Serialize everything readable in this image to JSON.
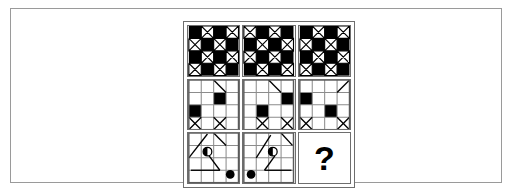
{
  "figure": {
    "kind": "matrix-reasoning-puzzle",
    "rows": 3,
    "columns": 3,
    "background_color": "#ffffff",
    "line_color": "#000000",
    "fill_color": "#000000",
    "frame_color": "#9a9a9a",
    "panel_border_color": "#6e6e6e"
  },
  "matrix": {
    "cells": [
      {
        "id": "cell-r1c1",
        "row": 1,
        "column": 1,
        "label": "top-left",
        "pattern": "checkerboard-4x4-with-triangles",
        "grid": 4,
        "black_squares": [
          [
            0,
            0
          ],
          [
            0,
            2
          ],
          [
            1,
            1
          ],
          [
            1,
            3
          ],
          [
            2,
            0
          ],
          [
            2,
            2
          ],
          [
            3,
            1
          ],
          [
            3,
            3
          ]
        ],
        "triangle_cells": [
          [
            0,
            1
          ],
          [
            0,
            3
          ],
          [
            1,
            0
          ],
          [
            1,
            2
          ],
          [
            2,
            1
          ],
          [
            2,
            3
          ],
          [
            3,
            0
          ],
          [
            3,
            2
          ]
        ],
        "is_question": false
      },
      {
        "id": "cell-r1c2",
        "row": 1,
        "column": 2,
        "label": "top-center",
        "pattern": "checkerboard-4x4-with-triangles",
        "grid": 4,
        "black_squares": [
          [
            0,
            1
          ],
          [
            0,
            3
          ],
          [
            1,
            0
          ],
          [
            1,
            2
          ],
          [
            2,
            1
          ],
          [
            2,
            3
          ],
          [
            3,
            0
          ],
          [
            3,
            2
          ]
        ],
        "triangle_cells": [
          [
            0,
            0
          ],
          [
            0,
            2
          ],
          [
            1,
            1
          ],
          [
            1,
            3
          ],
          [
            2,
            0
          ],
          [
            2,
            2
          ],
          [
            3,
            1
          ],
          [
            3,
            3
          ]
        ],
        "is_question": false
      },
      {
        "id": "cell-r1c3",
        "row": 1,
        "column": 3,
        "label": "top-right",
        "pattern": "checkerboard-4x4-with-triangles",
        "grid": 4,
        "black_squares": [
          [
            0,
            0
          ],
          [
            0,
            2
          ],
          [
            1,
            1
          ],
          [
            1,
            3
          ],
          [
            2,
            0
          ],
          [
            2,
            2
          ],
          [
            3,
            1
          ],
          [
            3,
            3
          ]
        ],
        "triangle_cells": [
          [
            0,
            1
          ],
          [
            0,
            3
          ],
          [
            1,
            0
          ],
          [
            1,
            2
          ],
          [
            2,
            1
          ],
          [
            2,
            3
          ],
          [
            3,
            0
          ],
          [
            3,
            2
          ]
        ],
        "is_question": false
      },
      {
        "id": "cell-r2c1",
        "row": 2,
        "column": 1,
        "label": "middle-left",
        "pattern": "grid-4x4-two-black-squares-two-diagonals",
        "grid": 4,
        "black_squares": [
          [
            1,
            2
          ],
          [
            2,
            0
          ]
        ],
        "diagonals": [
          {
            "from": [
              0,
              2
            ],
            "to": [
              1,
              1
            ],
            "direction": "down-left"
          },
          {
            "from": [
              3,
              0
            ],
            "to": [
              3,
              1
            ],
            "direction": "up-right"
          },
          {
            "from": [
              3,
              2
            ],
            "to": [
              3,
              3
            ],
            "direction": "up-right"
          }
        ],
        "is_question": false
      },
      {
        "id": "cell-r2c2",
        "row": 2,
        "column": 2,
        "label": "middle-center",
        "pattern": "grid-4x4-two-black-squares-two-diagonals",
        "grid": 4,
        "black_squares": [
          [
            1,
            3
          ],
          [
            2,
            1
          ]
        ],
        "diagonals": [
          {
            "from": [
              0,
              2
            ],
            "to": [
              1,
              2
            ],
            "direction": "down-right"
          },
          {
            "from": [
              3,
              1
            ],
            "to": [
              3,
              1
            ],
            "direction": "up-right"
          },
          {
            "from": [
              3,
              3
            ],
            "to": [
              3,
              3
            ],
            "direction": "up-right"
          }
        ],
        "is_question": false
      },
      {
        "id": "cell-r2c3",
        "row": 2,
        "column": 3,
        "label": "middle-right",
        "pattern": "grid-4x4-two-black-squares-two-diagonals",
        "grid": 4,
        "black_squares": [
          [
            1,
            0
          ],
          [
            2,
            2
          ]
        ],
        "diagonals": [
          {
            "from": [
              0,
              3
            ],
            "to": [
              0,
              3
            ],
            "direction": "down-left"
          },
          {
            "from": [
              3,
              0
            ],
            "to": [
              3,
              0
            ],
            "direction": "up-right"
          },
          {
            "from": [
              3,
              3
            ],
            "to": [
              3,
              3
            ],
            "direction": "up-right"
          }
        ],
        "is_question": false
      },
      {
        "id": "cell-r3c1",
        "row": 3,
        "column": 1,
        "label": "bottom-left",
        "pattern": "grid-4x4-half-circle-and-dot-with-diagonals",
        "grid": 4,
        "half_circle": {
          "row": 1,
          "column": 1,
          "filled_side": "left"
        },
        "filled_dot": {
          "row": 3,
          "column": 3
        },
        "is_question": false
      },
      {
        "id": "cell-r3c2",
        "row": 3,
        "column": 2,
        "label": "bottom-center",
        "pattern": "grid-4x4-half-circle-and-dot-with-diagonals",
        "grid": 4,
        "half_circle": {
          "row": 1,
          "column": 2,
          "filled_side": "left"
        },
        "filled_dot": {
          "row": 3,
          "column": 0
        },
        "is_question": false
      },
      {
        "id": "cell-r3c3",
        "row": 3,
        "column": 3,
        "label": "bottom-right-missing",
        "pattern": "question-mark",
        "is_question": true,
        "question_mark": "?"
      }
    ]
  }
}
